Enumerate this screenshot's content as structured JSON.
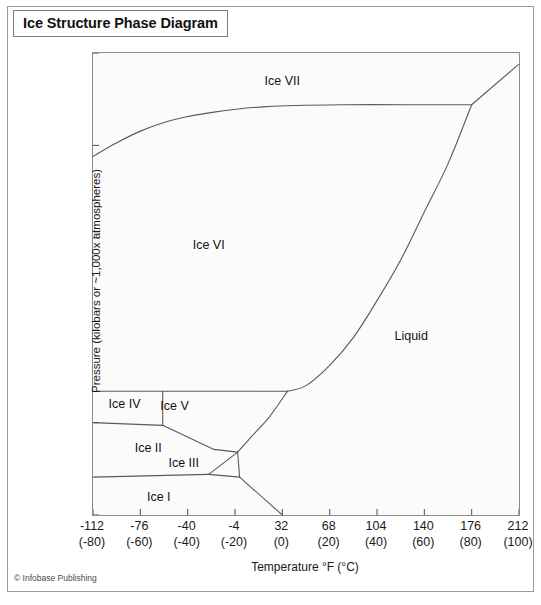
{
  "title": "Ice Structure Phase Diagram",
  "credit": "© Infobase Publishing",
  "axes": {
    "x_title": "Temperature °F (°C)",
    "y_title": "Pressure (kilobars or ~1,000x atmospheres)"
  },
  "chart_data": {
    "type": "line",
    "title": "Ice Structure Phase Diagram",
    "xlabel": "Temperature °F (°C)",
    "ylabel": "Pressure (kilobars or ~1,000x atmospheres)",
    "xlim": [
      -112,
      212
    ],
    "ylim": [
      0,
      25
    ],
    "grid": false,
    "legend": "none",
    "x_ticks_f": [
      -112,
      -76,
      -40,
      -4,
      32,
      68,
      104,
      140,
      176,
      212
    ],
    "x_ticks_c": [
      -80,
      -60,
      -40,
      -20,
      0,
      20,
      40,
      60,
      80,
      100
    ],
    "x_tick_labels": [
      "-112",
      "-76",
      "-40",
      "-4",
      "32",
      "68",
      "104",
      "140",
      "176",
      "212"
    ],
    "x_tick_sublabels": [
      "(-80)",
      "(-60)",
      "(-40)",
      "(-20)",
      "(0)",
      "(20)",
      "(40)",
      "(60)",
      "(80)",
      "(100)"
    ],
    "y_ticks": [
      0,
      5,
      10,
      15,
      20,
      25
    ],
    "y_tick_labels": [
      "0",
      "5",
      "10",
      "15",
      "20",
      "25"
    ],
    "regions": [
      {
        "name": "Ice VII",
        "label": "Ice VII",
        "x": 32,
        "y": 23.5
      },
      {
        "name": "Ice VI",
        "label": "Ice VI",
        "x": -24,
        "y": 14.6
      },
      {
        "name": "Liquid",
        "label": "Liquid",
        "x": 130,
        "y": 9.7
      },
      {
        "name": "Ice V",
        "label": "Ice V",
        "x": -50,
        "y": 5.9
      },
      {
        "name": "Ice IV",
        "label": "Ice IV",
        "x": -88,
        "y": 6.0
      },
      {
        "name": "Ice II",
        "label": "Ice II",
        "x": -70,
        "y": 3.6
      },
      {
        "name": "Ice III",
        "label": "Ice III",
        "x": -43,
        "y": 2.8
      },
      {
        "name": "Ice I",
        "label": "Ice I",
        "x": -62,
        "y": 1.0
      }
    ],
    "boundaries": [
      {
        "name": "ice6-ice7",
        "points": [
          [
            -112,
            19.4
          ],
          [
            -95,
            20.1
          ],
          [
            -75,
            20.8
          ],
          [
            -50,
            21.4
          ],
          [
            -20,
            21.8
          ],
          [
            20,
            22.1
          ],
          [
            80,
            22.2
          ],
          [
            140,
            22.2
          ],
          [
            176,
            22.2
          ]
        ]
      },
      {
        "name": "melting-curve",
        "points": [
          [
            176,
            22.2
          ],
          [
            212,
            24.4
          ]
        ]
      },
      {
        "name": "ice6-liquid",
        "points": [
          [
            176,
            22.2
          ],
          [
            158,
            19.0
          ],
          [
            140,
            16.4
          ],
          [
            122,
            13.8
          ],
          [
            104,
            11.6
          ],
          [
            86,
            9.6
          ],
          [
            68,
            8.1
          ],
          [
            50,
            7.0
          ],
          [
            36,
            6.7
          ]
        ]
      },
      {
        "name": "ice5-liquid",
        "points": [
          [
            36,
            6.7
          ],
          [
            22,
            5.3
          ],
          [
            8,
            4.2
          ],
          [
            -2,
            3.4
          ]
        ]
      },
      {
        "name": "ice6-top-horizontal",
        "points": [
          [
            -112,
            6.7
          ],
          [
            36,
            6.7
          ]
        ]
      },
      {
        "name": "ice4-right-vertical",
        "points": [
          [
            -59,
            6.7
          ],
          [
            -59,
            4.85
          ]
        ]
      },
      {
        "name": "ice4-bottom",
        "points": [
          [
            -112,
            5.0
          ],
          [
            -59,
            4.85
          ]
        ]
      },
      {
        "name": "ice5-ice2",
        "points": [
          [
            -59,
            4.85
          ],
          [
            -20,
            3.55
          ]
        ]
      },
      {
        "name": "ice2-ice3-top",
        "points": [
          [
            -20,
            3.55
          ],
          [
            -2,
            3.4
          ]
        ]
      },
      {
        "name": "ice3-right",
        "points": [
          [
            -2,
            3.4
          ],
          [
            -0.5,
            2.05
          ]
        ]
      },
      {
        "name": "ice2-ice3-left",
        "points": [
          [
            -24,
            2.2
          ],
          [
            -2,
            3.4
          ]
        ]
      },
      {
        "name": "ice1-ice2",
        "points": [
          [
            -112,
            2.05
          ],
          [
            -24,
            2.2
          ]
        ]
      },
      {
        "name": "ice3-ice1-bottom",
        "points": [
          [
            -24,
            2.2
          ],
          [
            -0.5,
            2.05
          ]
        ]
      },
      {
        "name": "ice1-liquid",
        "points": [
          [
            -0.5,
            2.05
          ],
          [
            32,
            0.0
          ]
        ]
      }
    ]
  }
}
